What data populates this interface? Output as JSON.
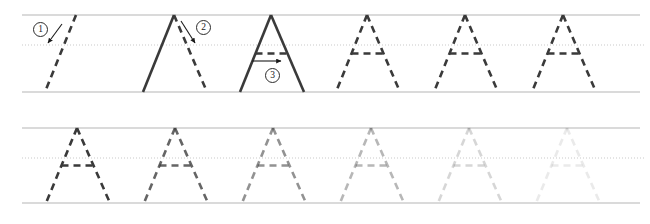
{
  "worksheet": {
    "letter": "A",
    "title": "Letter A handwriting practice worksheet",
    "width": 650,
    "height": 224,
    "background": "#ffffff"
  },
  "colors": {
    "rule_line": "#b6b6b6",
    "midline_dotted": "#c9c9c9",
    "stroke_solid": "#3a3a3a",
    "stroke_dashed": "#3a3a3a",
    "marker_text": "#1a1a1a",
    "marker_border": "#2b2b2b",
    "arrow": "#1a1a1a"
  },
  "rules": {
    "row1": {
      "top_line_y": 15,
      "mid_dotted_y": 45,
      "base_line_y": 92
    },
    "row2": {
      "top_line_y": 16,
      "mid_dotted_y": 46,
      "base_line_y": 91
    },
    "line_width": 1,
    "dotted_dash": "1,2"
  },
  "geometry": {
    "letter_pitch": 98,
    "apex_offset": 31,
    "half_base": 32,
    "crossbar_y_ratio": 0.5,
    "dash_pattern": "7,5",
    "stroke_width": 2.6
  },
  "rows": [
    {
      "id": "row-1",
      "name": "stroke-order-demo-row",
      "letters": [
        {
          "index": 1,
          "name": "letter-a-stroke-1-demo",
          "left_x": 45,
          "parts": {
            "left_diagonal": "dashed",
            "right_diagonal": "none",
            "crossbar": "none"
          },
          "opacity": 1.0
        },
        {
          "index": 2,
          "name": "letter-a-stroke-2-demo",
          "left_x": 143,
          "parts": {
            "left_diagonal": "solid",
            "right_diagonal": "dashed",
            "crossbar": "none"
          },
          "opacity": 1.0
        },
        {
          "index": 3,
          "name": "letter-a-stroke-3-demo",
          "left_x": 240,
          "parts": {
            "left_diagonal": "solid",
            "right_diagonal": "solid",
            "crossbar": "dashed"
          },
          "opacity": 1.0
        },
        {
          "index": 4,
          "name": "letter-a-trace-guide",
          "left_x": 336,
          "parts": {
            "left_diagonal": "dashed",
            "right_diagonal": "dashed",
            "crossbar": "dashed"
          },
          "opacity": 1.0
        },
        {
          "index": 5,
          "name": "letter-a-trace-guide",
          "left_x": 434,
          "parts": {
            "left_diagonal": "dashed",
            "right_diagonal": "dashed",
            "crossbar": "dashed"
          },
          "opacity": 1.0
        },
        {
          "index": 6,
          "name": "letter-a-trace-guide",
          "left_x": 532,
          "parts": {
            "left_diagonal": "dashed",
            "right_diagonal": "dashed",
            "crossbar": "dashed"
          },
          "opacity": 1.0
        }
      ]
    },
    {
      "id": "row-2",
      "name": "fading-trace-practice-row",
      "letters": [
        {
          "index": 1,
          "name": "letter-a-trace-guide",
          "left_x": 46,
          "parts": {
            "left_diagonal": "dashed",
            "right_diagonal": "dashed",
            "crossbar": "dashed"
          },
          "opacity": 1.0
        },
        {
          "index": 2,
          "name": "letter-a-trace-guide",
          "left_x": 144,
          "parts": {
            "left_diagonal": "dashed",
            "right_diagonal": "dashed",
            "crossbar": "dashed"
          },
          "opacity": 0.78
        },
        {
          "index": 3,
          "name": "letter-a-trace-guide",
          "left_x": 242,
          "parts": {
            "left_diagonal": "dashed",
            "right_diagonal": "dashed",
            "crossbar": "dashed"
          },
          "opacity": 0.55
        },
        {
          "index": 4,
          "name": "letter-a-trace-guide",
          "left_x": 340,
          "parts": {
            "left_diagonal": "dashed",
            "right_diagonal": "dashed",
            "crossbar": "dashed"
          },
          "opacity": 0.36
        },
        {
          "index": 5,
          "name": "letter-a-trace-guide",
          "left_x": 438,
          "parts": {
            "left_diagonal": "dashed",
            "right_diagonal": "dashed",
            "crossbar": "dashed"
          },
          "opacity": 0.2
        },
        {
          "index": 6,
          "name": "letter-a-trace-guide",
          "left_x": 536,
          "parts": {
            "left_diagonal": "dashed",
            "right_diagonal": "dashed",
            "crossbar": "dashed"
          },
          "opacity": 0.1
        }
      ]
    }
  ],
  "stroke_markers": [
    {
      "id": 1,
      "label": "1",
      "name": "stroke-order-marker-1",
      "x": 33,
      "y": 22
    },
    {
      "id": 2,
      "label": "2",
      "name": "stroke-order-marker-2",
      "x": 196,
      "y": 20
    },
    {
      "id": 3,
      "label": "3",
      "name": "stroke-order-marker-3",
      "x": 265,
      "y": 68
    }
  ],
  "stroke_arrows": [
    {
      "id": 1,
      "name": "stroke-direction-arrow-1",
      "direction": "down-left",
      "x1": 62,
      "y1": 24,
      "x2": 48,
      "y2": 43
    },
    {
      "id": 2,
      "name": "stroke-direction-arrow-2",
      "direction": "down-right",
      "x1": 181,
      "y1": 21,
      "x2": 195,
      "y2": 43
    },
    {
      "id": 3,
      "name": "stroke-direction-arrow-3",
      "direction": "right",
      "x1": 252,
      "y1": 61,
      "x2": 281,
      "y2": 61
    }
  ]
}
